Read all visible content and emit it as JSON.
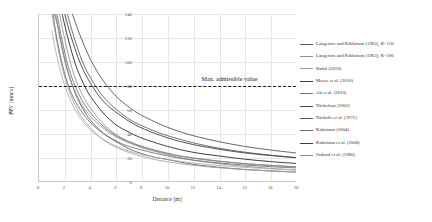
{
  "chart_data": {
    "type": "line",
    "title": "",
    "xlabel": "Distance [m]",
    "ylabel": "PPV [mm/s]",
    "xlim": [
      0,
      20
    ],
    "ylim": [
      0,
      140
    ],
    "xticks": [
      "0",
      "2",
      "4",
      "6",
      "8",
      "10",
      "12",
      "14",
      "16",
      "18",
      "20"
    ],
    "yticks": [
      "0",
      "20",
      "40",
      "60",
      "80",
      "100",
      "120",
      "140"
    ],
    "grid": true,
    "legend_position": "right",
    "annotations": [
      {
        "text": "Max. admissible value",
        "type": "threshold-line",
        "y": 80,
        "style": "dashed",
        "color": "#161616"
      }
    ],
    "series": [
      {
        "name": "Langefors and Kihlstrom (1963), K=150",
        "label_main": "Langefors and Kihlstrom (1963), ",
        "label_k": "K",
        "label_tail": "=150",
        "color": "#5a5a5a",
        "width": 0.85,
        "x": [
          1.2,
          1.5,
          2,
          2.5,
          3,
          3.5,
          4,
          5,
          6,
          7,
          8,
          9,
          10,
          12,
          14,
          16,
          18,
          20
        ],
        "y": [
          140,
          128,
          102,
          83,
          69,
          59,
          51,
          40,
          33,
          27,
          23,
          20,
          18,
          14,
          11.5,
          9.7,
          8.4,
          7.4
        ]
      },
      {
        "name": "Langefors and Kihlstrom (1963), K=200",
        "label_main": "Langefors and Kihlstrom (1963), ",
        "label_k": "K",
        "label_tail": "=200",
        "color": "#8f8f8f",
        "width": 0.85,
        "x": [
          1.6,
          2,
          2.5,
          3,
          3.5,
          4,
          5,
          6,
          7,
          8,
          9,
          10,
          12,
          14,
          16,
          18,
          20
        ],
        "y": [
          140,
          119,
          97,
          81,
          70,
          61,
          48,
          39,
          33,
          28,
          25,
          22,
          17.5,
          14.5,
          12.3,
          10.6,
          9.3
        ]
      },
      {
        "name": "Badal (2010)",
        "label_main": "Badal (2010)",
        "label_k": "",
        "label_tail": "",
        "color": "#9e9e9e",
        "width": 0.85,
        "x": [
          1.0,
          1.3,
          1.7,
          2.2,
          2.8,
          3.5,
          4.5,
          5.5,
          7,
          9,
          11,
          13,
          15,
          17,
          20
        ],
        "y": [
          140,
          122,
          100,
          80,
          64,
          51,
          39,
          31,
          24,
          18,
          14.5,
          12,
          10.3,
          9,
          7.6
        ]
      },
      {
        "name": "Mesec et al. (2010)",
        "label_main": "Mesec et al. (2010)",
        "label_k": "",
        "label_tail": "",
        "color": "#3c3c3c",
        "width": 1.0,
        "x": [
          1.8,
          2.2,
          2.8,
          3.4,
          4,
          5,
          6,
          7,
          8,
          10,
          12,
          14,
          16,
          18,
          20
        ],
        "y": [
          140,
          122,
          99,
          83,
          71,
          57,
          47,
          41,
          36,
          29,
          24,
          21,
          18.3,
          16.3,
          14.7
        ]
      },
      {
        "name": "Ak et al. (2010)",
        "label_main": "Ak et al. (2010)",
        "label_k": "",
        "label_tail": "",
        "color": "#707070",
        "width": 0.85,
        "x": [
          1.4,
          1.8,
          2.3,
          3,
          3.8,
          4.8,
          6,
          7.5,
          9,
          11,
          13,
          15,
          17,
          20
        ],
        "y": [
          140,
          118,
          95,
          75,
          60,
          48,
          38,
          31,
          26,
          21,
          18,
          15.5,
          13.8,
          11.9
        ]
      },
      {
        "name": "Nicholson (2005)",
        "label_main": "Nicholson (2005)",
        "label_k": "",
        "label_tail": "",
        "color": "#4a4a4a",
        "width": 0.85,
        "x": [
          2.6,
          3.2,
          4,
          5,
          6,
          7,
          8,
          10,
          12,
          14,
          16,
          18,
          20
        ],
        "y": [
          140,
          122,
          102,
          84,
          71,
          62,
          55,
          45,
          38,
          33,
          29,
          26,
          23.5
        ]
      },
      {
        "name": "Nicholls et al. (1971)",
        "label_main": "Nicholls et al. (1971)",
        "label_k": "",
        "label_tail": "",
        "color": "#555555",
        "width": 0.85,
        "x": [
          2.2,
          2.8,
          3.5,
          4.5,
          5.5,
          7,
          8.5,
          10,
          12,
          14,
          16,
          18,
          20
        ],
        "y": [
          140,
          118,
          97,
          78,
          65,
          52,
          44,
          38,
          32,
          27.5,
          24.2,
          21.7,
          19.7
        ]
      },
      {
        "name": "Kahriman (2004)",
        "label_main": "Kahriman (2004)",
        "label_k": "",
        "label_tail": "",
        "color": "#6b6b6b",
        "width": 0.85,
        "x": [
          1.1,
          1.4,
          1.9,
          2.5,
          3.2,
          4,
          5,
          6.5,
          8,
          10,
          12,
          15,
          18,
          20
        ],
        "y": [
          140,
          119,
          94,
          74,
          60,
          49,
          40,
          31,
          26,
          21,
          17.5,
          14.2,
          12,
          11
        ]
      },
      {
        "name": "Kahriman et al. (2006)",
        "label_main": "Kahriman et al. (2006)",
        "label_k": "",
        "label_tail": "",
        "color": "#3f3f3f",
        "width": 0.9,
        "x": [
          2.0,
          2.5,
          3.2,
          4,
          5,
          6.2,
          7.5,
          9,
          11,
          13,
          15,
          17,
          20
        ],
        "y": [
          140,
          121,
          99,
          82,
          67,
          56,
          47,
          40,
          33,
          28.5,
          25,
          22.4,
          19.5
        ]
      },
      {
        "name": "Siskind et al. (1980)",
        "label_main": "Siskind et al. (1980)",
        "label_k": "",
        "label_tail": "",
        "color": "#8a8a8a",
        "width": 0.85,
        "x": [
          1.3,
          1.7,
          2.2,
          2.9,
          3.7,
          4.7,
          6,
          7.5,
          9.5,
          12,
          14.5,
          17,
          20
        ],
        "y": [
          140,
          116,
          93,
          73,
          58,
          47,
          37,
          30,
          24,
          19,
          16,
          13.8,
          11.8
        ]
      },
      {
        "name": "Lower envelope",
        "label_main": "",
        "label_k": "",
        "label_tail": "",
        "color": "#a8a8a8",
        "width": 0.8,
        "legend_hidden": true,
        "x": [
          1.0,
          1.4,
          2,
          2.8,
          3.8,
          5,
          6.5,
          8.5,
          11,
          14,
          17,
          20
        ],
        "y": [
          126,
          104,
          80,
          60,
          45,
          35,
          27,
          21,
          16.5,
          13,
          10.8,
          9.2
        ]
      }
    ]
  }
}
